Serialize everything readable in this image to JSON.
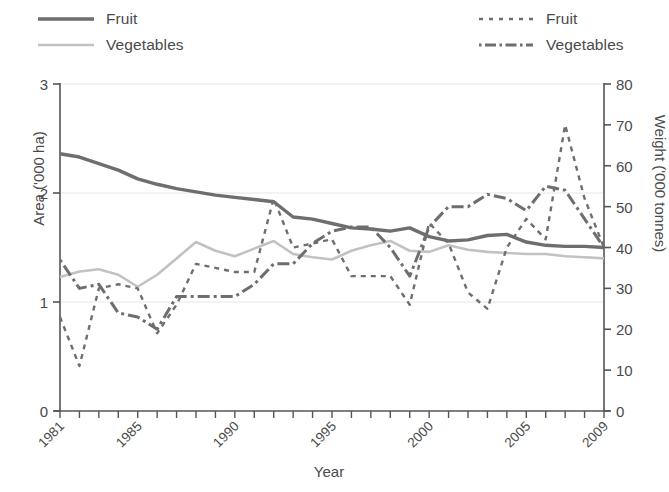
{
  "legend": {
    "left": [
      {
        "label": "Fruit",
        "style": "solid",
        "color": "#6e6e6e",
        "width": 3.4
      },
      {
        "label": "Vegetables",
        "style": "solid",
        "color": "#c2c2c2",
        "width": 2.6
      }
    ],
    "right": [
      {
        "label": "Fruit",
        "style": "dashed",
        "color": "#6e6e6e",
        "width": 2.4
      },
      {
        "label": "Vegetables",
        "style": "dashdot",
        "color": "#6e6e6e",
        "width": 3.0
      }
    ]
  },
  "chart_data": {
    "type": "line",
    "title": "",
    "xlabel": "Year",
    "ylabel": "Area ('000 ha)",
    "y2label": "Weight ('000 tonnes)",
    "xlim": [
      1981,
      2009
    ],
    "ylim": [
      0,
      3
    ],
    "y2lim": [
      0,
      80
    ],
    "yticks": [
      0,
      1,
      2,
      3
    ],
    "y2ticks": [
      0,
      10,
      20,
      30,
      40,
      50,
      60,
      70,
      80
    ],
    "xticks": [
      1981,
      1982,
      1983,
      1984,
      1985,
      1986,
      1987,
      1988,
      1989,
      1990,
      1991,
      1992,
      1993,
      1994,
      1995,
      1996,
      1997,
      1998,
      1999,
      2000,
      2001,
      2002,
      2003,
      2004,
      2005,
      2006,
      2007,
      2008,
      2009
    ],
    "xticklabels": {
      "1981": "1981",
      "1985": "1985",
      "1990": "1990",
      "1995": "1995",
      "2000": "2000",
      "2005": "2005",
      "2009": "2009"
    },
    "grid": "horizontal",
    "legend_position": "top",
    "x": [
      1981,
      1982,
      1983,
      1984,
      1985,
      1986,
      1987,
      1988,
      1989,
      1990,
      1991,
      1992,
      1993,
      1994,
      1995,
      1996,
      1997,
      1998,
      1999,
      2000,
      2001,
      2002,
      2003,
      2004,
      2005,
      2006,
      2007,
      2008,
      2009
    ],
    "series": [
      {
        "name": "Fruit",
        "axis": "left",
        "unit": "'000 ha",
        "style": "solid",
        "color": "#6e6e6e",
        "values": [
          2.36,
          2.33,
          2.27,
          2.21,
          2.13,
          2.08,
          2.04,
          2.01,
          1.98,
          1.96,
          1.94,
          1.92,
          1.78,
          1.76,
          1.72,
          1.68,
          1.67,
          1.65,
          1.68,
          1.6,
          1.56,
          1.57,
          1.61,
          1.62,
          1.55,
          1.52,
          1.51,
          1.51,
          1.5
        ]
      },
      {
        "name": "Vegetables",
        "axis": "left",
        "unit": "'000 ha",
        "style": "solid",
        "color": "#c2c2c2",
        "values": [
          1.23,
          1.28,
          1.3,
          1.25,
          1.14,
          1.25,
          1.4,
          1.55,
          1.47,
          1.42,
          1.49,
          1.56,
          1.44,
          1.41,
          1.39,
          1.47,
          1.52,
          1.56,
          1.47,
          1.46,
          1.52,
          1.48,
          1.46,
          1.45,
          1.44,
          1.44,
          1.42,
          1.41,
          1.4
        ]
      },
      {
        "name": "Fruit",
        "axis": "right",
        "unit": "'000 tonnes",
        "style": "dashed",
        "color": "#6e6e6e",
        "values": [
          23,
          11,
          30,
          31,
          30,
          19,
          26,
          36,
          35,
          34,
          34,
          52,
          40,
          41,
          42,
          33,
          33,
          33,
          26,
          46,
          41,
          29,
          25,
          40,
          47,
          42,
          70,
          52,
          40
        ]
      },
      {
        "name": "Vegetables",
        "axis": "right",
        "unit": "'000 tonnes",
        "style": "dashdot",
        "color": "#6e6e6e",
        "values": [
          37,
          30,
          31,
          24,
          23,
          20,
          28,
          28,
          28,
          28,
          31,
          36,
          36,
          41,
          44,
          45,
          45,
          40,
          33,
          45,
          50,
          50,
          53,
          52,
          49,
          55,
          54,
          47,
          40
        ]
      }
    ]
  }
}
